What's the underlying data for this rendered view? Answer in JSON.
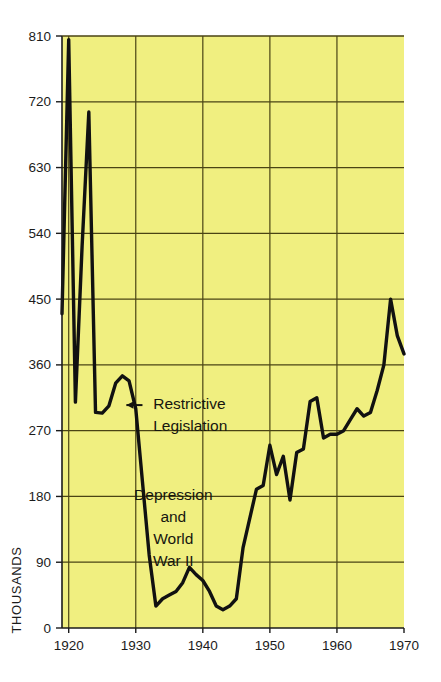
{
  "figure": {
    "background_color": "#ffffff",
    "plot_background_color": "#f0ef80",
    "grid_color": "#4a4414",
    "axis_color": "#1b1b1b",
    "line_color": "#111111"
  },
  "chart_data": {
    "type": "line",
    "title": "",
    "subtitle": "",
    "xlabel": "",
    "ylabel": "THOUSANDS",
    "xlim": [
      1919,
      1970
    ],
    "ylim": [
      0,
      810
    ],
    "grid": true,
    "legend": null,
    "x_ticks": [
      1920,
      1930,
      1940,
      1950,
      1960,
      1970
    ],
    "x_tick_labels": [
      "1920",
      "1930",
      "1940",
      "1950",
      "1960",
      "1970"
    ],
    "y_ticks": [
      0,
      90,
      180,
      270,
      360,
      450,
      540,
      630,
      720,
      810
    ],
    "y_tick_labels": [
      "0",
      "90",
      "180",
      "270",
      "360",
      "450",
      "540",
      "630",
      "720",
      "810"
    ],
    "series": [
      {
        "name": "Immigration",
        "x": [
          1919,
          1920,
          1921,
          1922,
          1923,
          1924,
          1925,
          1926,
          1927,
          1928,
          1929,
          1930,
          1931,
          1932,
          1933,
          1934,
          1935,
          1936,
          1937,
          1938,
          1939,
          1940,
          1941,
          1942,
          1943,
          1944,
          1945,
          1946,
          1947,
          1948,
          1949,
          1950,
          1951,
          1952,
          1953,
          1954,
          1955,
          1956,
          1957,
          1958,
          1959,
          1960,
          1961,
          1962,
          1963,
          1964,
          1965,
          1966,
          1967,
          1968,
          1969,
          1970
        ],
        "y": [
          430,
          805,
          309,
          523,
          706,
          295,
          294,
          304,
          335,
          345,
          338,
          300,
          200,
          100,
          30,
          40,
          45,
          50,
          62,
          83,
          73,
          65,
          50,
          30,
          25,
          30,
          40,
          110,
          150,
          190,
          195,
          250,
          210,
          235,
          175,
          240,
          245,
          310,
          315,
          260,
          265,
          265,
          270,
          285,
          300,
          290,
          295,
          325,
          360,
          450,
          400,
          375
        ]
      }
    ],
    "annotations": [
      {
        "id": "restrictive-legislation",
        "lines": [
          "Restrictive",
          "Legislation"
        ],
        "x": 1932.6,
        "y": 300,
        "arrow": {
          "direction": "left",
          "from_x": 1931.0,
          "from_y": 305,
          "to_x": 1928.6,
          "to_y": 305
        }
      },
      {
        "id": "depression-world-war-ii",
        "lines": [
          "Depression",
          "and",
          "World",
          "War II"
        ],
        "x": 1935.6,
        "y": 175
      }
    ]
  }
}
